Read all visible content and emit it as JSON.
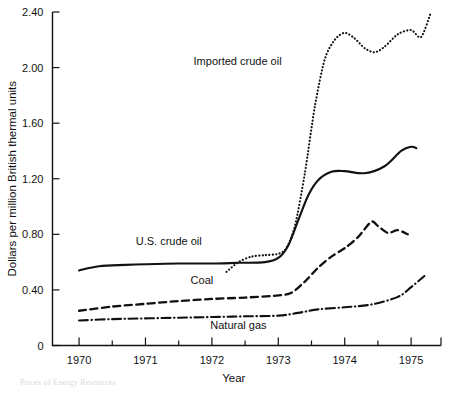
{
  "chart_data": {
    "type": "line",
    "title": "",
    "xlabel": "Year",
    "ylabel": "Dollars per million British thermal units",
    "xlim": [
      1969.6,
      1975.45
    ],
    "ylim": [
      0,
      2.4
    ],
    "grid": false,
    "legend_position": "inline-annotations",
    "x_ticks_major": [
      "1970",
      "1971",
      "1972",
      "1973",
      "1974",
      "1975"
    ],
    "x_tick_values": [
      1970,
      1971,
      1972,
      1973,
      1974,
      1975
    ],
    "x_minor_tick_values": [
      1970.5,
      1971.5,
      1972.5,
      1973.5,
      1974.5
    ],
    "y_ticks": [
      "0",
      "0.40",
      "0.80",
      "1.20",
      "1.60",
      "2.00",
      "2.40"
    ],
    "y_tick_values": [
      0,
      0.4,
      0.8,
      1.2,
      1.6,
      2.0,
      2.4
    ],
    "series": [
      {
        "name": "Imported crude oil",
        "style": "dotted",
        "color": "#111111",
        "x": [
          1972.22,
          1972.4,
          1972.6,
          1972.8,
          1973.0,
          1973.12,
          1973.25,
          1973.4,
          1973.55,
          1973.7,
          1973.85,
          1974.0,
          1974.15,
          1974.3,
          1974.45,
          1974.6,
          1974.8,
          1975.0,
          1975.15,
          1975.3
        ],
        "y": [
          0.53,
          0.6,
          0.64,
          0.65,
          0.66,
          0.7,
          0.86,
          1.24,
          1.72,
          2.06,
          2.2,
          2.25,
          2.21,
          2.14,
          2.11,
          2.15,
          2.24,
          2.27,
          2.22,
          2.4
        ]
      },
      {
        "name": "U.S. crude oil",
        "style": "solid",
        "color": "#111111",
        "x": [
          1970.0,
          1970.3,
          1970.7,
          1971.0,
          1971.5,
          1972.0,
          1972.4,
          1972.8,
          1973.0,
          1973.15,
          1973.3,
          1973.45,
          1973.6,
          1973.8,
          1974.0,
          1974.3,
          1974.6,
          1974.85,
          1975.0,
          1975.08
        ],
        "y": [
          0.54,
          0.57,
          0.58,
          0.585,
          0.59,
          0.59,
          0.595,
          0.6,
          0.63,
          0.72,
          0.9,
          1.08,
          1.19,
          1.25,
          1.255,
          1.24,
          1.29,
          1.4,
          1.43,
          1.42
        ]
      },
      {
        "name": "Coal",
        "style": "dashed",
        "color": "#111111",
        "x": [
          1970.0,
          1970.5,
          1971.0,
          1971.5,
          1972.0,
          1972.5,
          1973.0,
          1973.2,
          1973.4,
          1973.6,
          1973.8,
          1974.0,
          1974.2,
          1974.4,
          1974.5,
          1974.65,
          1974.8,
          1974.95
        ],
        "y": [
          0.25,
          0.28,
          0.3,
          0.32,
          0.335,
          0.345,
          0.36,
          0.38,
          0.46,
          0.56,
          0.64,
          0.7,
          0.78,
          0.89,
          0.86,
          0.81,
          0.83,
          0.8
        ]
      },
      {
        "name": "Natural gas",
        "style": "dashdot",
        "color": "#111111",
        "x": [
          1970.0,
          1970.5,
          1971.0,
          1971.5,
          1972.0,
          1972.5,
          1973.0,
          1973.3,
          1973.6,
          1974.0,
          1974.4,
          1974.8,
          1975.0,
          1975.2
        ],
        "y": [
          0.18,
          0.19,
          0.195,
          0.2,
          0.205,
          0.21,
          0.215,
          0.235,
          0.26,
          0.275,
          0.295,
          0.35,
          0.42,
          0.5
        ]
      }
    ],
    "annotations": [
      {
        "text": "Imported crude oil",
        "x": 1973.05,
        "y": 2.02,
        "anchor": "end"
      },
      {
        "text": "U.S. crude oil",
        "x": 1971.35,
        "y": 0.72,
        "anchor": "middle"
      },
      {
        "text": "Coal",
        "x": 1971.85,
        "y": 0.44,
        "anchor": "middle"
      },
      {
        "text": "Natural gas",
        "x": 1972.4,
        "y": 0.12,
        "anchor": "middle"
      }
    ]
  },
  "axes": {
    "y_title": "Dollars per million British thermal units",
    "x_title": "Year"
  },
  "footer": {
    "caption_fragment": "Prices of Energy Resources"
  }
}
